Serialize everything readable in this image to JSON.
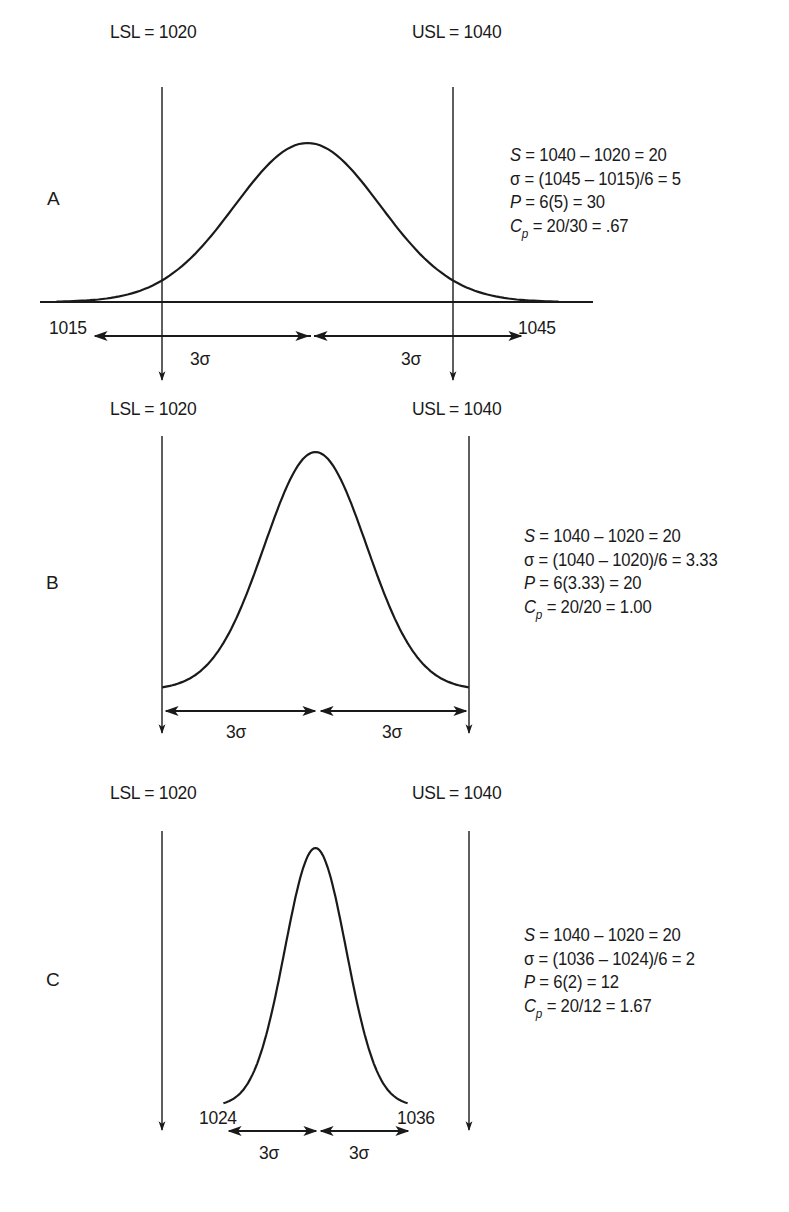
{
  "figure": {
    "panels": [
      {
        "id": "A",
        "letter": "A",
        "lsl_label": "LSL = 1020",
        "usl_label": "USL = 1040",
        "lsl": 1020,
        "usl": 1040,
        "mean": 1030,
        "sigma": 5,
        "tail_low_label": "1015",
        "tail_high_label": "1045",
        "sigma_left_label": "3σ",
        "sigma_right_label": "3σ",
        "formulas": {
          "s": {
            "var": "S",
            "text": " = 1040 – 1020 = 20"
          },
          "sigma": {
            "var": "σ",
            "text": " = (1045 – 1015)/6 = 5"
          },
          "p": {
            "var": "P",
            "text": " = 6(5) = 30"
          },
          "cp": {
            "var": "C",
            "sub": "p",
            "text": " = 20/30 = .67"
          }
        }
      },
      {
        "id": "B",
        "letter": "B",
        "lsl_label": "LSL = 1020",
        "usl_label": "USL = 1040",
        "lsl": 1020,
        "usl": 1040,
        "mean": 1030,
        "sigma": 3.33,
        "sigma_left_label": "3σ",
        "sigma_right_label": "3σ",
        "formulas": {
          "s": {
            "var": "S",
            "text": " = 1040 – 1020 = 20"
          },
          "sigma": {
            "var": "σ",
            "text": " = (1040 – 1020)/6 = 3.33"
          },
          "p": {
            "var": "P",
            "text": " = 6(3.33) = 20"
          },
          "cp": {
            "var": "C",
            "sub": "p",
            "text": " = 20/20 = 1.00"
          }
        }
      },
      {
        "id": "C",
        "letter": "C",
        "lsl_label": "LSL = 1020",
        "usl_label": "USL = 1040",
        "lsl": 1020,
        "usl": 1040,
        "mean": 1030,
        "sigma": 2,
        "tail_low_label": "1024",
        "tail_high_label": "1036",
        "sigma_left_label": "3σ",
        "sigma_right_label": "3σ",
        "formulas": {
          "s": {
            "var": "S",
            "text": " = 1040 – 1020 = 20"
          },
          "sigma": {
            "var": "σ",
            "text": " = (1036 – 1024)/6 = 2"
          },
          "p": {
            "var": "P",
            "text": " = 6(2) = 12"
          },
          "cp": {
            "var": "C",
            "sub": "p",
            "text": " = 20/12 = 1.67"
          }
        }
      }
    ],
    "colors": {
      "ink": "#1a1a1a",
      "background": "#ffffff"
    }
  }
}
